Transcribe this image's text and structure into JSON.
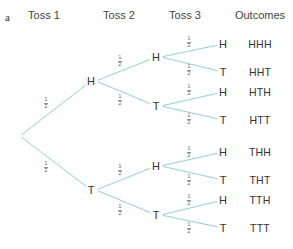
{
  "panel_label": "a",
  "headers": [
    {
      "label": "Toss 1",
      "x": 44
    },
    {
      "label": "Toss 2",
      "x": 119
    },
    {
      "label": "Toss 3",
      "x": 185
    },
    {
      "label": "Outcomes",
      "x": 260
    }
  ],
  "line_color": "#8ecfdc",
  "root": {
    "x": 20,
    "y": 136
  },
  "toss1": [
    {
      "label": "H",
      "x": 91,
      "y": 81,
      "prob": {
        "num": "1",
        "den": "2",
        "x": 46,
        "y": 103
      }
    },
    {
      "label": "T",
      "x": 91,
      "y": 190,
      "prob": {
        "num": "1",
        "den": "2",
        "x": 46,
        "y": 167
      }
    }
  ],
  "toss2": [
    {
      "label": "H",
      "x": 156,
      "y": 57,
      "parent": 0,
      "prob": {
        "num": "1",
        "den": "2",
        "x": 120,
        "y": 61
      }
    },
    {
      "label": "T",
      "x": 156,
      "y": 106,
      "parent": 0,
      "prob": {
        "num": "1",
        "den": "2",
        "x": 120,
        "y": 100
      }
    },
    {
      "label": "H",
      "x": 156,
      "y": 166,
      "parent": 1,
      "prob": {
        "num": "1",
        "den": "2",
        "x": 120,
        "y": 170
      }
    },
    {
      "label": "T",
      "x": 156,
      "y": 215,
      "parent": 1,
      "prob": {
        "num": "1",
        "den": "2",
        "x": 120,
        "y": 210
      }
    }
  ],
  "toss3": [
    {
      "label": "H",
      "x": 223,
      "y": 44,
      "parent": 0,
      "prob": {
        "num": "1",
        "den": "2",
        "x": 189,
        "y": 42
      },
      "outcome": "HHH"
    },
    {
      "label": "T",
      "x": 223,
      "y": 72,
      "parent": 0,
      "prob": {
        "num": "1",
        "den": "2",
        "x": 189,
        "y": 70
      },
      "outcome": "HHT"
    },
    {
      "label": "H",
      "x": 223,
      "y": 92,
      "parent": 1,
      "prob": {
        "num": "1",
        "den": "2",
        "x": 189,
        "y": 90
      },
      "outcome": "HTH"
    },
    {
      "label": "T",
      "x": 223,
      "y": 120,
      "parent": 1,
      "prob": {
        "num": "1",
        "den": "2",
        "x": 189,
        "y": 119
      },
      "outcome": "HTT"
    },
    {
      "label": "H",
      "x": 223,
      "y": 152,
      "parent": 2,
      "prob": {
        "num": "1",
        "den": "2",
        "x": 189,
        "y": 152
      },
      "outcome": "THH"
    },
    {
      "label": "T",
      "x": 223,
      "y": 180,
      "parent": 2,
      "prob": {
        "num": "1",
        "den": "2",
        "x": 189,
        "y": 180
      },
      "outcome": "THT"
    },
    {
      "label": "H",
      "x": 223,
      "y": 200,
      "parent": 3,
      "prob": {
        "num": "1",
        "den": "2",
        "x": 189,
        "y": 200
      },
      "outcome": "TTH"
    },
    {
      "label": "T",
      "x": 223,
      "y": 228,
      "parent": 3,
      "prob": {
        "num": "1",
        "den": "2",
        "x": 189,
        "y": 228
      },
      "outcome": "TTT"
    }
  ],
  "outcome_x": 260
}
